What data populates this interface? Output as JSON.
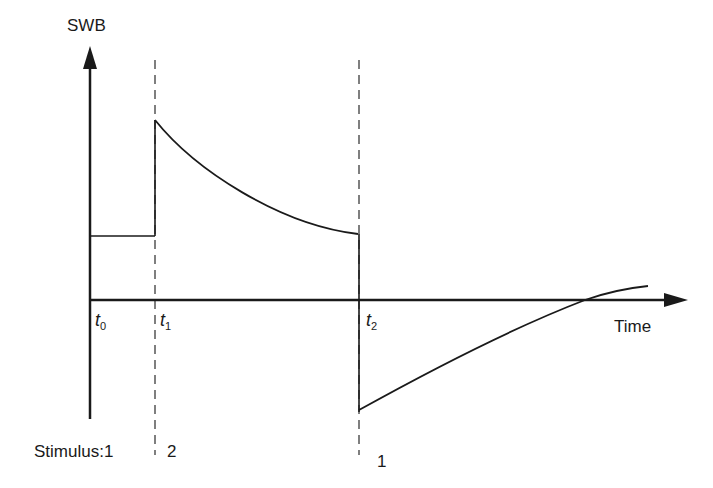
{
  "diagram": {
    "type": "time-series-schematic",
    "y_axis": {
      "label": "SWB"
    },
    "x_axis": {
      "label": "Time"
    },
    "time_marks": [
      {
        "id": "t0",
        "base": "t",
        "sub": "0"
      },
      {
        "id": "t1",
        "base": "t",
        "sub": "1"
      },
      {
        "id": "t2",
        "base": "t",
        "sub": "2"
      }
    ],
    "stimulus": {
      "prefix": "Stimulus:",
      "values": [
        "1",
        "2",
        "1"
      ]
    },
    "segments": [
      {
        "name": "baseline",
        "from": "t0",
        "to": "t1",
        "shape": "flat",
        "level": "moderate positive"
      },
      {
        "name": "after-stimulus-2",
        "from": "t1",
        "to": "t2",
        "shape": "jump up then decaying curve",
        "level": "high to moderate"
      },
      {
        "name": "after-stimulus-1",
        "from": "t2",
        "to": "end",
        "shape": "drop below zero then rising curve crossing axis",
        "level": "negative to slightly positive"
      }
    ],
    "colors": {
      "line": "#1a1a1a",
      "dashed": "#555555",
      "background": "#ffffff"
    }
  }
}
